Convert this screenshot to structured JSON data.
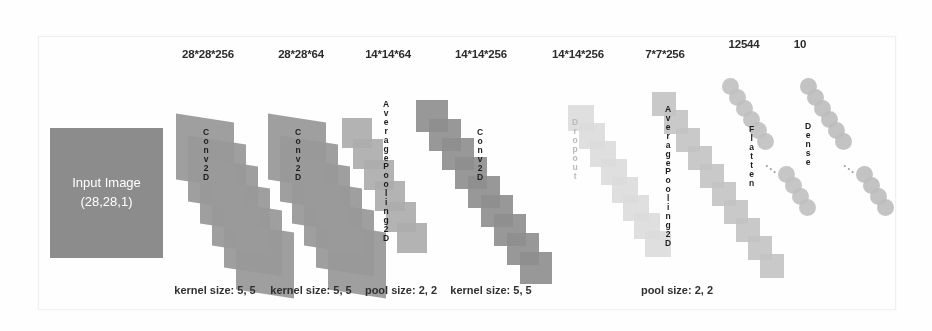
{
  "diagram": {
    "input": {
      "line1": "Input Image",
      "line2": "(28,28,1)",
      "color": "#8c8c8c"
    },
    "top_labels": [
      {
        "text": "28*28*256",
        "x": 208
      },
      {
        "text": "28*28*64",
        "x": 301
      },
      {
        "text": "14*14*64",
        "x": 388
      },
      {
        "text": "14*14*256",
        "x": 481
      },
      {
        "text": "14*14*256",
        "x": 578
      },
      {
        "text": "7*7*256",
        "x": 665
      },
      {
        "text": "12544",
        "x": 744
      },
      {
        "text": "10",
        "x": 800
      }
    ],
    "bottom_labels": [
      {
        "text": "kernel size: 5, 5",
        "x": 215
      },
      {
        "text": "kernel size: 5, 5",
        "x": 311
      },
      {
        "text": "pool size: 2, 2",
        "x": 401
      },
      {
        "text": "kernel size: 5, 5",
        "x": 491
      },
      {
        "text": "pool size: 2, 2",
        "x": 677
      }
    ],
    "layers": [
      {
        "name": "Conv2D",
        "letters": [
          "C",
          "o",
          "n",
          "v",
          "2",
          "D"
        ],
        "color": "#9a9a9a",
        "style": "cards"
      },
      {
        "name": "Conv2D",
        "letters": [
          "C",
          "o",
          "n",
          "v",
          "2",
          "D"
        ],
        "color": "#9a9a9a",
        "style": "cards"
      },
      {
        "name": "AveragePooling2D",
        "letters": [
          "A",
          "v",
          "e",
          "r",
          "a",
          "g",
          "e",
          "P",
          "o",
          "o",
          "l",
          "i",
          "n",
          "g",
          "2",
          "D"
        ],
        "color": "#acacac",
        "style": "squares"
      },
      {
        "name": "Conv2D",
        "letters": [
          "C",
          "o",
          "n",
          "v",
          "2",
          "D"
        ],
        "color": "#8f8f8f",
        "style": "squares"
      },
      {
        "name": "Dropout",
        "letters": [
          "D",
          "r",
          "o",
          "p",
          "o",
          "u",
          "t"
        ],
        "color": "#dcdcdc",
        "style": "squares"
      },
      {
        "name": "AveragePooling2D",
        "letters": [
          "A",
          "v",
          "e",
          "r",
          "a",
          "g",
          "e",
          "P",
          "o",
          "o",
          "l",
          "i",
          "n",
          "g",
          "2",
          "D"
        ],
        "color": "#c4c4c4",
        "style": "squares"
      },
      {
        "name": "Flatten",
        "letters": [
          "F",
          "l",
          "a",
          "t",
          "t",
          "e",
          "n"
        ],
        "color": "#c0c0c0",
        "style": "nodes"
      },
      {
        "name": "Dense",
        "letters": [
          "D",
          "e",
          "n",
          "s",
          "e"
        ],
        "color": "#bdbdbd",
        "style": "nodes"
      }
    ],
    "ellipsis": "..."
  }
}
